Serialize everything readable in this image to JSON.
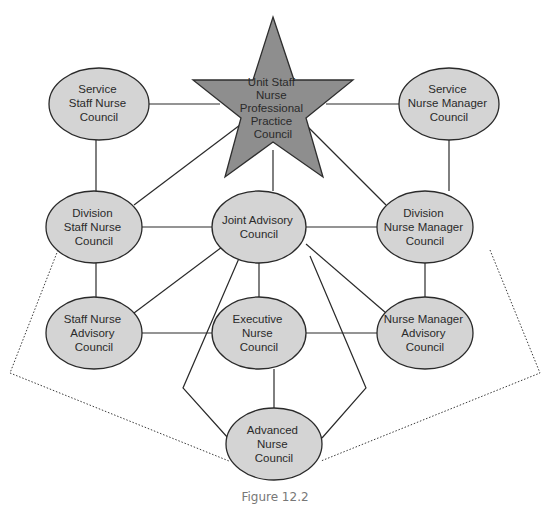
{
  "diagram": {
    "caption": "Figure 12.2",
    "colors": {
      "node_fill": "#d4d4d4",
      "star_fill": "#8e8e8e",
      "stroke": "#2a2a2a",
      "caption": "#777777"
    },
    "center": {
      "id": "unit-staff",
      "shape": "star",
      "lines": [
        "Unit Staff",
        "Nurse",
        "Professional",
        "Practice",
        "Council"
      ]
    },
    "nodes": [
      {
        "id": "service-staff",
        "lines": [
          "Service",
          "Staff Nurse",
          "Council"
        ]
      },
      {
        "id": "service-manager",
        "lines": [
          "Service",
          "Nurse Manager",
          "Council"
        ]
      },
      {
        "id": "division-staff",
        "lines": [
          "Division",
          "Staff Nurse",
          "Council"
        ]
      },
      {
        "id": "joint-advisory",
        "lines": [
          "Joint Advisory",
          "Council"
        ]
      },
      {
        "id": "division-manager",
        "lines": [
          "Division",
          "Nurse Manager",
          "Council"
        ]
      },
      {
        "id": "staff-advisory",
        "lines": [
          "Staff Nurse",
          "Advisory",
          "Council"
        ]
      },
      {
        "id": "executive",
        "lines": [
          "Executive",
          "Nurse",
          "Council"
        ]
      },
      {
        "id": "manager-advisory",
        "lines": [
          "Nurse Manager",
          "Advisory",
          "Council"
        ]
      },
      {
        "id": "advanced",
        "lines": [
          "Advanced",
          "Nurse",
          "Council"
        ]
      }
    ],
    "edges": [
      {
        "from": "service-staff",
        "to": "unit-staff",
        "style": "solid"
      },
      {
        "from": "service-manager",
        "to": "unit-staff",
        "style": "solid"
      },
      {
        "from": "service-staff",
        "to": "division-staff",
        "style": "solid"
      },
      {
        "from": "service-manager",
        "to": "division-manager",
        "style": "solid"
      },
      {
        "from": "division-staff",
        "to": "unit-staff",
        "style": "solid"
      },
      {
        "from": "division-manager",
        "to": "unit-staff",
        "style": "solid"
      },
      {
        "from": "joint-advisory",
        "to": "unit-staff",
        "style": "solid"
      },
      {
        "from": "division-staff",
        "to": "joint-advisory",
        "style": "solid"
      },
      {
        "from": "joint-advisory",
        "to": "division-manager",
        "style": "solid"
      },
      {
        "from": "division-staff",
        "to": "staff-advisory",
        "style": "solid"
      },
      {
        "from": "division-manager",
        "to": "manager-advisory",
        "style": "solid"
      },
      {
        "from": "joint-advisory",
        "to": "staff-advisory",
        "style": "solid"
      },
      {
        "from": "joint-advisory",
        "to": "manager-advisory",
        "style": "solid"
      },
      {
        "from": "joint-advisory",
        "to": "executive",
        "style": "solid"
      },
      {
        "from": "joint-advisory",
        "to": "advanced",
        "style": "solid-bent-left"
      },
      {
        "from": "joint-advisory",
        "to": "advanced",
        "style": "solid-bent-right"
      },
      {
        "from": "staff-advisory",
        "to": "executive",
        "style": "solid"
      },
      {
        "from": "executive",
        "to": "manager-advisory",
        "style": "solid"
      },
      {
        "from": "executive",
        "to": "advanced",
        "style": "solid"
      },
      {
        "from": "division-staff",
        "to": "advanced",
        "style": "dotted"
      },
      {
        "from": "division-manager",
        "to": "advanced",
        "style": "dotted"
      }
    ]
  }
}
